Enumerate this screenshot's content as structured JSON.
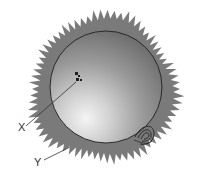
{
  "diagram": {
    "labels": [
      {
        "id": "X",
        "text": "X",
        "points_to": "sunspots"
      },
      {
        "id": "Y",
        "text": "Y",
        "points_to": "corona"
      }
    ],
    "colors": {
      "corona": "#7a7a7a",
      "sphere_dark": "#6e6e6e",
      "sphere_light": "#f2f2f2",
      "outline": "#2a2a2a",
      "background": "#ffffff"
    }
  }
}
